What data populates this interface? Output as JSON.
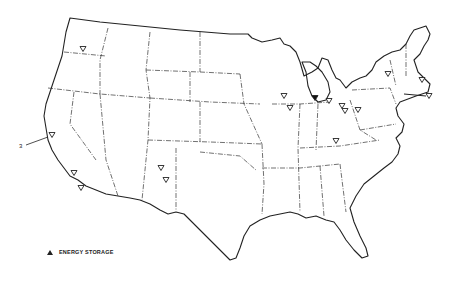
{
  "map": {
    "title": "Energy Storage Sites",
    "region": "Contiguous United States",
    "callout_label": "3",
    "legend": {
      "items": [
        {
          "symbol": "triangle",
          "label": "ENERGY STORAGE"
        }
      ]
    },
    "markers": [
      {
        "id": "wa",
        "x": 83,
        "y": 49,
        "filled": false
      },
      {
        "id": "ca-north",
        "x": 52,
        "y": 135,
        "filled": false
      },
      {
        "id": "ca-south-1",
        "x": 74,
        "y": 173,
        "filled": false
      },
      {
        "id": "ca-south-2",
        "x": 81,
        "y": 188,
        "filled": false
      },
      {
        "id": "nm-1",
        "x": 161,
        "y": 168,
        "filled": false
      },
      {
        "id": "nm-2",
        "x": 166,
        "y": 180,
        "filled": false
      },
      {
        "id": "wi",
        "x": 284,
        "y": 96,
        "filled": false
      },
      {
        "id": "il",
        "x": 290,
        "y": 108,
        "filled": false
      },
      {
        "id": "mi",
        "x": 315,
        "y": 98,
        "filled": true
      },
      {
        "id": "oh-1",
        "x": 329,
        "y": 101,
        "filled": false
      },
      {
        "id": "oh-2",
        "x": 342,
        "y": 106,
        "filled": false
      },
      {
        "id": "oh-3",
        "x": 345,
        "y": 111,
        "filled": false
      },
      {
        "id": "pa",
        "x": 358,
        "y": 110,
        "filled": false
      },
      {
        "id": "ky",
        "x": 336,
        "y": 141,
        "filled": false
      },
      {
        "id": "ny",
        "x": 388,
        "y": 74,
        "filled": false
      },
      {
        "id": "ma",
        "x": 422,
        "y": 80,
        "filled": false
      },
      {
        "id": "ri-offshore",
        "x": 429,
        "y": 96,
        "filled": false
      }
    ]
  }
}
